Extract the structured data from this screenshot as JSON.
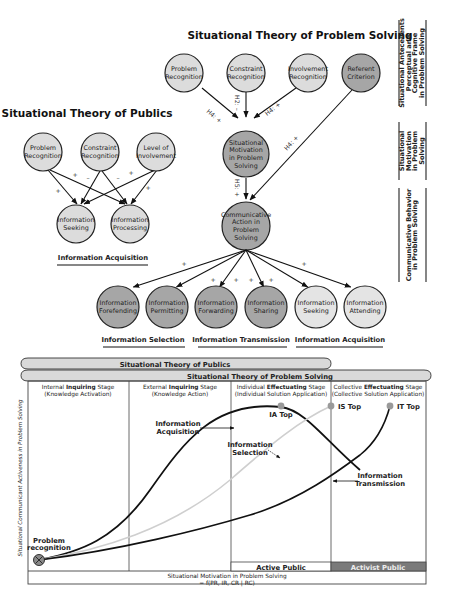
{
  "top_diagram": {
    "stps_title": "Situational Theory of Problem Solving",
    "stp_title": "Situational Theory of Publics",
    "stp_nodes": [
      {
        "id": "pr",
        "lines": [
          "Problem",
          "Recognition"
        ],
        "fill": "#dcdcdc"
      },
      {
        "id": "cr",
        "lines": [
          "Constraint",
          "Recognition"
        ],
        "fill": "#dcdcdc"
      },
      {
        "id": "li",
        "lines": [
          "Level of",
          "Involvement"
        ],
        "fill": "#dcdcdc"
      },
      {
        "id": "is",
        "lines": [
          "Information",
          "Seeking"
        ],
        "fill": "#dcdcdc"
      },
      {
        "id": "ip",
        "lines": [
          "Information",
          "Processing"
        ],
        "fill": "#dcdcdc"
      }
    ],
    "stp_edge_signs": [
      "+",
      "+",
      "–",
      "–",
      "+",
      "+"
    ],
    "stp_group_label": "Information Acquisition",
    "stps_nodes": [
      {
        "id": "pr2",
        "lines": [
          "Problem",
          "Recognition"
        ],
        "fill": "#dcdcdc"
      },
      {
        "id": "cr2",
        "lines": [
          "Constraint",
          "Recognition"
        ],
        "fill": "#dcdcdc"
      },
      {
        "id": "ir2",
        "lines": [
          "Involvement",
          "Recognition"
        ],
        "fill": "#dcdcdc"
      },
      {
        "id": "rc",
        "lines": [
          "Referent",
          "Criterion"
        ],
        "fill": "#a6a6a6"
      },
      {
        "id": "sm",
        "lines": [
          "Situational",
          "Motivation",
          "in Problem",
          "Solving"
        ],
        "fill": "#a6a6a6"
      },
      {
        "id": "ca",
        "lines": [
          "Communicative",
          "Action in",
          "Problem",
          "Solving"
        ],
        "fill": "#a6a6a6"
      }
    ],
    "stps_edge_labels": {
      "pr_sm": "H4: +",
      "cr_sm": "H2: –",
      "ir_sm": "H4: +",
      "rc_ca": "H4: +",
      "sm_ca": "H5: +"
    },
    "behavior_nodes": [
      {
        "lines": [
          "Information",
          "Forefending"
        ],
        "fill": "#a6a6a6"
      },
      {
        "lines": [
          "Information",
          "Permitting"
        ],
        "fill": "#a6a6a6"
      },
      {
        "lines": [
          "Information",
          "Forwarding"
        ],
        "fill": "#a6a6a6"
      },
      {
        "lines": [
          "Information",
          "Sharing"
        ],
        "fill": "#a6a6a6"
      },
      {
        "lines": [
          "Information",
          "Seeking"
        ],
        "fill": "#e4e4e4"
      },
      {
        "lines": [
          "Information",
          "Attending"
        ],
        "fill": "#e4e4e4"
      }
    ],
    "behavior_edge_signs": [
      "+",
      "+",
      "+",
      "+",
      "+",
      "+"
    ],
    "behavior_groups": [
      "Information Selection",
      "Information Transmission",
      "Information Acquisition"
    ],
    "side_labels": [
      [
        "Situational Antecedents",
        "Perceptual and",
        "Cognitive Frame",
        "in Problem Solving"
      ],
      [
        "Situational",
        "Motivation",
        "in Problem",
        "Solving"
      ],
      [
        "Communicative Behavior",
        "in Problem Solving"
      ]
    ]
  },
  "bottom_chart": {
    "bar_publics": "Situational Theory of Publics",
    "bar_problem_solving": "Situational Theory of Problem Solving",
    "stages": [
      {
        "prefix": "Internal ",
        "bold": "Inquiring",
        "suffix": " Stage",
        "sub": "(Knowledge Activation)"
      },
      {
        "prefix": "External ",
        "bold": "Inquiring",
        "suffix": " Stage",
        "sub": "(Knowledge Action)"
      },
      {
        "prefix": "Individual ",
        "bold": "Effectuating",
        "suffix": " Stage",
        "sub": "(Individual Solution Application)"
      },
      {
        "prefix": "Collective ",
        "bold": "Effectuating",
        "suffix": " Stage",
        "sub": "(Collective Solution Application)"
      }
    ],
    "y_axis_label": "Situational Communicant Activeness in Problem Solving",
    "x_axis_label_1": "Situational Motivation in Problem Solving",
    "x_axis_label_2": "= f(PR, IR, CR | RC)",
    "origin_label": [
      "Problem",
      "recognition"
    ],
    "curves": [
      {
        "name": "Information Acquisition",
        "label": [
          "Information",
          "Acquisition"
        ],
        "peak": "IA Top",
        "color": "#111111"
      },
      {
        "name": "Information Selection",
        "label": [
          "Information",
          "Selection"
        ],
        "peak": "IS Top",
        "color": "#cfcfcf"
      },
      {
        "name": "Information Transmission",
        "label": [
          "Information",
          "Transmission"
        ],
        "peak": "IT Top",
        "color": "#111111"
      }
    ],
    "public_labels": {
      "active": "Active Public",
      "activist": "Activist Public"
    },
    "colors": {
      "activist_bg": "#7a7a7a",
      "peak_dot": "#9a9a9a"
    }
  }
}
